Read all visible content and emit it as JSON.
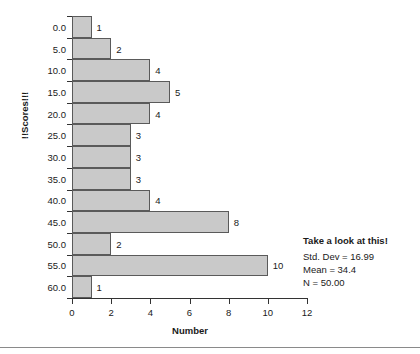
{
  "chart_data": {
    "type": "bar",
    "orientation": "horizontal",
    "title": "",
    "xlabel": "Number",
    "ylabel": "!!Scores!!!",
    "categories": [
      "0.0",
      "5.0",
      "10.0",
      "15.0",
      "20.0",
      "25.0",
      "30.0",
      "35.0",
      "40.0",
      "45.0",
      "50.0",
      "55.0",
      "60.0"
    ],
    "values": [
      1,
      2,
      4,
      5,
      4,
      3,
      3,
      3,
      4,
      8,
      2,
      10,
      1
    ],
    "value_labels": [
      "1",
      "2",
      "4",
      "5",
      "4",
      "3",
      "3",
      "3",
      "4",
      "8",
      "2",
      "10",
      "1"
    ],
    "xlim": [
      0,
      12
    ],
    "xticks": [
      0,
      2,
      4,
      6,
      8,
      10,
      12
    ],
    "xtick_labels": [
      "0",
      "2",
      "4",
      "6",
      "8",
      "10",
      "12"
    ],
    "grid": false,
    "legend": false,
    "bar_fill_color": "#c9c9c9",
    "bar_border_color": "#5a5a5a",
    "axis_color": "#333333"
  },
  "annotation": {
    "title": "Take a look at this!",
    "lines": [
      "Std. Dev = 16.99",
      "Mean = 34.4",
      "N = 50.00"
    ],
    "std_dev": "16.99",
    "mean": "34.4",
    "n": "50.00"
  }
}
